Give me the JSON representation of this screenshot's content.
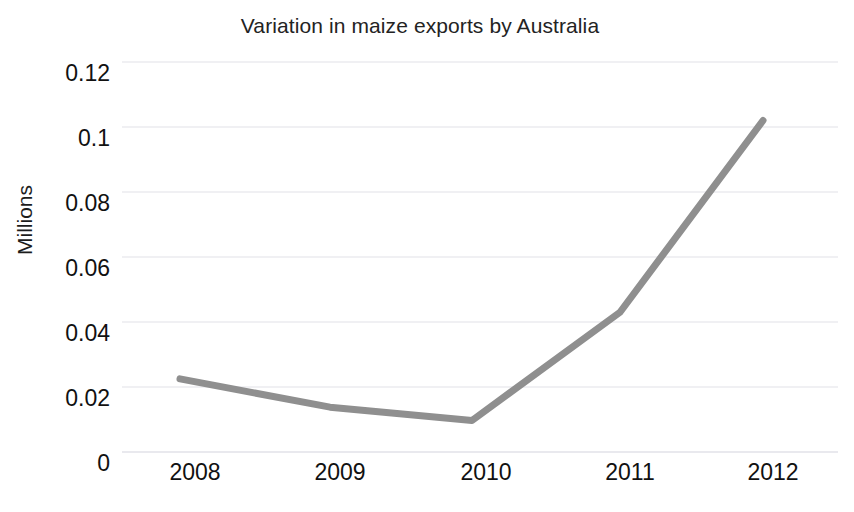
{
  "chart_data": {
    "type": "line",
    "title": "Variation in maize exports by Australia",
    "xlabel": "",
    "ylabel": "Millions",
    "categories": [
      "2008",
      "2009",
      "2010",
      "2011",
      "2012"
    ],
    "values": [
      0.0225,
      0.0138,
      0.0097,
      0.043,
      0.102
    ],
    "series": [
      {
        "name": "Maize exports",
        "values": [
          0.0225,
          0.0138,
          0.0097,
          0.043,
          0.102
        ]
      }
    ],
    "ylim": [
      0,
      0.12
    ],
    "yticks": [
      "0",
      "0.02",
      "0.04",
      "0.06",
      "0.08",
      "0.1",
      "0.12"
    ],
    "ytick_values": [
      0,
      0.02,
      0.04,
      0.06,
      0.08,
      0.1,
      0.12
    ],
    "xticks": [
      "2008",
      "2009",
      "2010",
      "2011",
      "2012"
    ],
    "grid": true,
    "grid_axis": "y",
    "legend": false,
    "legend_position": "none",
    "line_color": "#8f8f8f",
    "grid_color": "#e2e2e8",
    "background_color": "#ffffff",
    "text_color": "#111111"
  }
}
